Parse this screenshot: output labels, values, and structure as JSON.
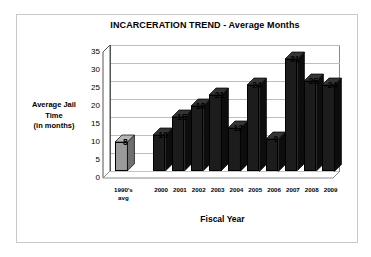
{
  "chart_data": {
    "type": "bar",
    "title": "INCARCERATION TREND - Average Months",
    "xlabel": "Fiscal Year",
    "ylabel_lines": [
      "Average Jail",
      "Time",
      "(in months)"
    ],
    "ylabel": "Average Jail Time (in months)",
    "categories": [
      "1990's avg",
      "",
      "2000",
      "2001",
      "2002",
      "2003",
      "2004",
      "2005",
      "2006",
      "2007",
      "2008",
      "2009"
    ],
    "category_lines": [
      [
        "1990's",
        "avg"
      ],
      [
        ""
      ],
      [
        "2000"
      ],
      [
        "2001"
      ],
      [
        "2002"
      ],
      [
        "2003"
      ],
      [
        "2004"
      ],
      [
        "2005"
      ],
      [
        "2006"
      ],
      [
        "2007"
      ],
      [
        "2008"
      ],
      [
        "2009"
      ]
    ],
    "values": [
      8,
      null,
      10,
      15,
      18,
      21,
      12,
      24,
      9,
      31,
      25,
      24
    ],
    "data_labels": [
      "8",
      "",
      "10",
      "15",
      "18",
      "21",
      "12",
      "24",
      "9",
      "31",
      "25",
      "24"
    ],
    "ylim": [
      0,
      35
    ],
    "yticks": [
      0,
      5,
      10,
      15,
      20,
      25,
      30,
      35
    ],
    "ytick_labels": [
      "0",
      "5",
      "10",
      "15",
      "20",
      "25",
      "30",
      "35"
    ],
    "grid": true,
    "legend": false,
    "bar_colors": [
      "#9a9a9a",
      "none",
      "#1c1c1c",
      "#1c1c1c",
      "#1c1c1c",
      "#1c1c1c",
      "#1c1c1c",
      "#1c1c1c",
      "#1c1c1c",
      "#1c1c1c",
      "#1c1c1c",
      "#1c1c1c"
    ],
    "style": "3d-column",
    "colors": {
      "background": "#ffffff",
      "frame_border": "#c9c9c9",
      "axis": "#555555",
      "gridline": "#bdbdbd",
      "bar_primary": "#1c1c1c",
      "bar_highlight": "#9a9a9a",
      "text": "#000000"
    }
  }
}
